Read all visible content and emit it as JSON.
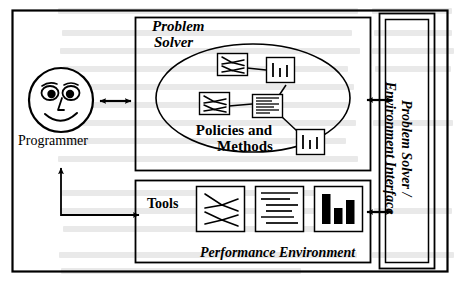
{
  "diagram": {
    "stroke_color": "#000000",
    "fill_color": "#ffffff",
    "background": "#ffffff"
  },
  "actor": {
    "label": "Programmer",
    "icon": "smiley-face-icon"
  },
  "problem_solver": {
    "title_line1": "Problem",
    "title_line2": "Solver",
    "ellipse_label_line1": "Policies and",
    "ellipse_label_line2": "Methods",
    "nodes": [
      {
        "id": "n1",
        "icon": "tree-diagram-icon"
      },
      {
        "id": "n2",
        "icon": "bar-chart-icon"
      },
      {
        "id": "n3",
        "icon": "tree-diagram-icon"
      },
      {
        "id": "n4",
        "icon": "document-lines-icon"
      },
      {
        "id": "n5",
        "icon": "bar-chart-icon"
      }
    ],
    "edges": [
      {
        "from": "n1",
        "to": "n2"
      },
      {
        "from": "n2",
        "to": "n4"
      },
      {
        "from": "n3",
        "to": "n4"
      },
      {
        "from": "n4",
        "to": "n5"
      }
    ]
  },
  "performance_environment": {
    "tools_label": "Tools",
    "footer_label": "Performance Environment",
    "tools": [
      {
        "id": "t1",
        "icon": "tree-diagram-icon"
      },
      {
        "id": "t2",
        "icon": "document-lines-icon"
      },
      {
        "id": "t3",
        "icon": "bar-chart-solid-icon"
      }
    ]
  },
  "interface_panel": {
    "label_line1": "Problem Solver /",
    "label_line2": "Environment Interface"
  },
  "connectors": [
    {
      "id": "c1",
      "name": "programmer-to-problem-solver",
      "style": "double-headed"
    },
    {
      "id": "c2",
      "name": "problem-solver-to-interface",
      "style": "double-headed"
    },
    {
      "id": "c3",
      "name": "performance-environment-to-interface",
      "style": "double-headed"
    },
    {
      "id": "c4",
      "name": "programmer-to-tools-feedback",
      "style": "double-headed-elbow"
    }
  ]
}
